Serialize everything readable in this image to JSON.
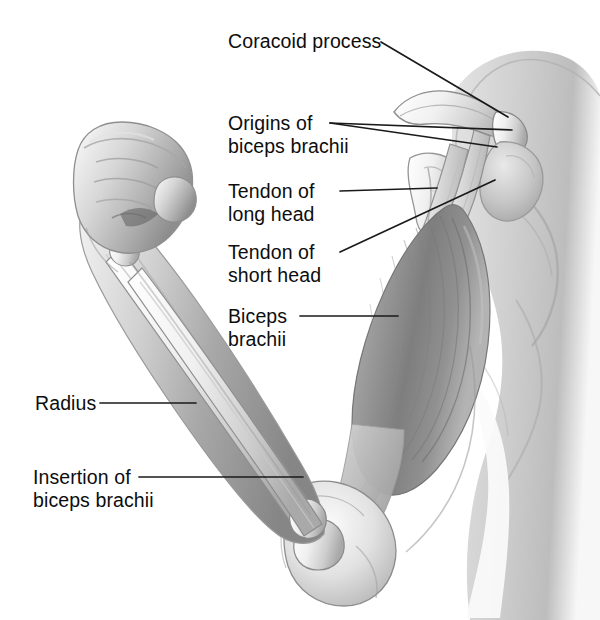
{
  "figure": {
    "style": "grayscale medical illustration",
    "background_color": "#ffffff",
    "text_color": "#0d0d0d",
    "leader_color": "#1a1a1a",
    "width": 600,
    "height": 620
  },
  "labels": [
    {
      "id": "coracoid-process",
      "text": "Coracoid process",
      "lines": [
        "Coracoid process"
      ],
      "x": 228,
      "y": 30,
      "align": "left",
      "leaders": [
        [
          [
            381,
            42
          ],
          [
            508,
            117
          ]
        ]
      ]
    },
    {
      "id": "origins-of-biceps-brachii",
      "text": "Origins of biceps brachii",
      "lines": [
        "Origins of",
        "biceps brachii"
      ],
      "x": 228,
      "y": 112,
      "align": "left",
      "leaders": [
        [
          [
            330,
            123
          ],
          [
            512,
            130
          ]
        ],
        [
          [
            330,
            123
          ],
          [
            497,
            147
          ]
        ]
      ]
    },
    {
      "id": "tendon-of-long-head",
      "text": "Tendon of long head",
      "lines": [
        "Tendon of",
        "long head"
      ],
      "x": 228,
      "y": 180,
      "align": "left",
      "leaders": [
        [
          [
            340,
            191
          ],
          [
            437,
            188
          ]
        ]
      ]
    },
    {
      "id": "tendon-of-short-head",
      "text": "Tendon of short head",
      "lines": [
        "Tendon of",
        "short head"
      ],
      "x": 228,
      "y": 241,
      "align": "left",
      "leaders": [
        [
          [
            340,
            252
          ],
          [
            495,
            180
          ]
        ]
      ]
    },
    {
      "id": "biceps-brachii",
      "text": "Biceps brachii",
      "lines": [
        "Biceps",
        "brachii"
      ],
      "x": 228,
      "y": 305,
      "align": "left",
      "leaders": [
        [
          [
            300,
            316
          ],
          [
            398,
            316
          ]
        ]
      ]
    },
    {
      "id": "radius",
      "text": "Radius",
      "lines": [
        "Radius"
      ],
      "x": 35,
      "y": 392,
      "align": "left",
      "leaders": [
        [
          [
            100,
            403
          ],
          [
            196,
            403
          ]
        ]
      ]
    },
    {
      "id": "insertion-of-biceps-brachii",
      "text": "Insertion of biceps brachii",
      "lines": [
        "Insertion of",
        "biceps brachii"
      ],
      "x": 33,
      "y": 466,
      "align": "left",
      "leaders": [
        [
          [
            139,
            477
          ],
          [
            303,
            477
          ]
        ]
      ]
    }
  ],
  "structures": [
    {
      "name": "clenched-fist",
      "region": "upper-left"
    },
    {
      "name": "forearm-radius-ulna",
      "region": "left-diagonal"
    },
    {
      "name": "elbow-joint",
      "region": "lower-center"
    },
    {
      "name": "biceps-brachii-belly",
      "region": "center-right"
    },
    {
      "name": "tendon-long-head",
      "region": "upper-right"
    },
    {
      "name": "tendon-short-head",
      "region": "upper-right"
    },
    {
      "name": "scapula-coracoid-process",
      "region": "top-right"
    },
    {
      "name": "shoulder-deltoid",
      "region": "top-right"
    },
    {
      "name": "torso-silhouette",
      "region": "right-edge"
    }
  ]
}
